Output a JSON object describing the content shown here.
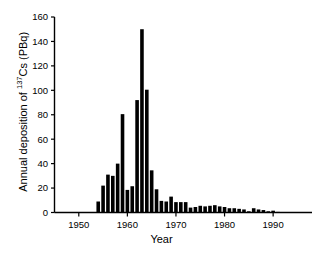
{
  "chart_data": {
    "type": "bar",
    "title": "",
    "xlabel": "Year",
    "ylabel_plain": "Annual deposition of 137Cs (PBq)",
    "ylabel_prefix": "Annual deposition of ",
    "ylabel_sup": "137",
    "ylabel_suffix": "Cs (PBq)",
    "xlim": [
      1945,
      1998
    ],
    "ylim": [
      0,
      160
    ],
    "yticks": [
      0,
      20,
      40,
      60,
      80,
      100,
      120,
      140,
      160
    ],
    "ytick_labels": [
      "0",
      "20",
      "40",
      "60",
      "80",
      "100",
      "120",
      "140",
      "160"
    ],
    "xticks": [
      1950,
      1960,
      1970,
      1980,
      1990
    ],
    "xtick_labels": [
      "1950",
      "1960",
      "1970",
      "1980",
      "1990"
    ],
    "grid": false,
    "legend": "none",
    "bar_color": "#000000",
    "axis_color": "#000000",
    "categories": [
      1945,
      1946,
      1947,
      1948,
      1949,
      1950,
      1951,
      1952,
      1953,
      1954,
      1955,
      1956,
      1957,
      1958,
      1959,
      1960,
      1961,
      1962,
      1963,
      1964,
      1965,
      1966,
      1967,
      1968,
      1969,
      1970,
      1971,
      1972,
      1973,
      1974,
      1975,
      1976,
      1977,
      1978,
      1979,
      1980,
      1981,
      1982,
      1983,
      1984,
      1985,
      1986,
      1987,
      1988,
      1989,
      1990,
      1991,
      1992,
      1993,
      1994,
      1995,
      1996,
      1997,
      1998
    ],
    "values": [
      0,
      0,
      0,
      0,
      0,
      0,
      0,
      0,
      0,
      9,
      22,
      31,
      30,
      40,
      80.5,
      18.5,
      21.5,
      92,
      150,
      100.5,
      34.5,
      19,
      9.5,
      9,
      13,
      8.5,
      8.5,
      8.5,
      4,
      4.5,
      5.5,
      5,
      5.5,
      6,
      5,
      4.5,
      3.5,
      3.5,
      3,
      2.5,
      1,
      3.5,
      2.5,
      2,
      1,
      1.5,
      0.5,
      0,
      0,
      0,
      0,
      0,
      0,
      0
    ]
  }
}
